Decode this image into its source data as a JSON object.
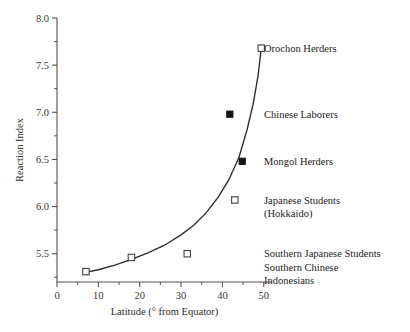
{
  "chart_data": {
    "type": "scatter",
    "title": "",
    "xlabel": "Latitude (° from Equator)",
    "ylabel": "Reaction Index",
    "xlim": [
      0,
      52
    ],
    "ylim": [
      5.2,
      8.0
    ],
    "grid": false,
    "legend_position": "none",
    "x_ticks": [
      0,
      10,
      20,
      30,
      40,
      50
    ],
    "x_tick_labels": [
      "0",
      "10",
      "20",
      "30",
      "40",
      "50"
    ],
    "x_minor_ticks": [
      5,
      15,
      25,
      35,
      45
    ],
    "y_ticks": [
      5.5,
      6.0,
      6.5,
      7.0,
      7.5,
      8.0
    ],
    "y_tick_labels": [
      "5.5",
      "6.0",
      "6.5",
      "7.0",
      "7.5",
      "8.0"
    ],
    "y_minor_ticks": [
      5.25,
      5.75,
      6.25,
      6.75,
      7.25,
      7.75
    ],
    "points": [
      {
        "label": "Indonesians",
        "x": 7.0,
        "y": 5.31,
        "marker": "open-square"
      },
      {
        "label": "Southern Chinese",
        "x": 18.0,
        "y": 5.46,
        "marker": "open-square"
      },
      {
        "label": "Southern Japanese Students",
        "x": 31.5,
        "y": 5.5,
        "marker": "open-square"
      },
      {
        "label": "Japanese Students (Hokkaido)",
        "x": 43.0,
        "y": 6.07,
        "marker": "open-square"
      },
      {
        "label": "Mongol Herders",
        "x": 44.8,
        "y": 6.48,
        "marker": "filled-square"
      },
      {
        "label": "Chinese Laborers",
        "x": 41.8,
        "y": 6.98,
        "marker": "filled-square"
      },
      {
        "label": "Orochon Herders",
        "x": 49.4,
        "y": 7.68,
        "marker": "open-square"
      }
    ],
    "fit_curve": {
      "description": "exponential trend line through points",
      "x": [
        6.5,
        10,
        14,
        18,
        22,
        26,
        30,
        33,
        36,
        39,
        41.5,
        44,
        46,
        47.5,
        48.6,
        49.4
      ],
      "y": [
        5.3,
        5.33,
        5.38,
        5.44,
        5.51,
        5.59,
        5.7,
        5.8,
        5.93,
        6.1,
        6.28,
        6.52,
        6.82,
        7.1,
        7.38,
        7.68
      ]
    },
    "annotations": [
      {
        "name": "orochon-herders",
        "lines": [
          "Orochon Herders"
        ],
        "x": 49.4,
        "y": 7.68
      },
      {
        "name": "chinese-laborers",
        "lines": [
          "Chinese Laborers"
        ],
        "x": 41.8,
        "y": 6.98
      },
      {
        "name": "mongol-herders",
        "lines": [
          "Mongol Herders"
        ],
        "x": 44.8,
        "y": 6.48
      },
      {
        "name": "japanese-students",
        "lines": [
          "Japanese Students",
          "(Hokkaido)"
        ],
        "x": 43.0,
        "y": 6.07
      },
      {
        "name": "southern-groups",
        "lines": [
          "Southern Japanese Students",
          "Southern Chinese",
          "Indonesians"
        ],
        "x": 31.5,
        "y": 5.5
      }
    ],
    "colors": {
      "axis": "#55534f",
      "curve": "#2b2b2b",
      "marker_open_fill": "#ffffff",
      "marker_open_stroke": "#4a4845",
      "marker_filled": "#141414",
      "text": "#252321",
      "background": "#ffffff"
    }
  }
}
